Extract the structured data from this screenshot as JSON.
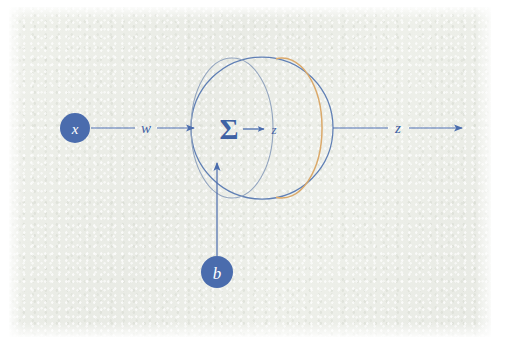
{
  "figure": {
    "kind": "neuron-computation-diagram",
    "background_color": "#eceee8",
    "margin_color": "#ffffff"
  },
  "palette": {
    "node_fill": "#4a6cad",
    "node_text": "#ffffff",
    "line_blue": "#4a6cad",
    "sphere_outline": "#5f7fb5",
    "inner_ellipse": "#93a5bf",
    "accent_orange": "#dba96a",
    "label_blue": "#3f62a4"
  },
  "nodes": [
    {
      "id": "input-node",
      "label": "x",
      "cx": 75,
      "cy": 128,
      "r": 15
    },
    {
      "id": "bias-node",
      "label": "b",
      "cx": 217,
      "cy": 272,
      "r": 16
    }
  ],
  "edges": [
    {
      "id": "weight-edge",
      "label": "w",
      "from": "input-node",
      "to": "neuron-body",
      "label_x": 146,
      "label_y": 127
    },
    {
      "id": "bias-edge",
      "label": "",
      "from": "bias-node",
      "to": "neuron-body"
    },
    {
      "id": "internal-edge",
      "label": "z",
      "from": "sum-symbol",
      "to": "activation-surface",
      "label_x": 273,
      "label_y": 133
    },
    {
      "id": "output-edge",
      "label": "z",
      "from": "neuron-body",
      "to": "output",
      "label_x": 398,
      "label_y": 127
    }
  ],
  "neuron_body": {
    "id": "neuron-body",
    "cx": 262,
    "cy": 128,
    "r": 71,
    "inner_ellipse": {
      "cx": 232,
      "cy": 128,
      "rx": 41,
      "ry": 70
    },
    "accent_ellipse": {
      "cx": 290,
      "cy": 128,
      "rx": 40,
      "ry": 70
    },
    "sum_symbol": "Σ",
    "sum_x": 229,
    "sum_y": 138
  },
  "labels": {
    "input": "x",
    "weight": "w",
    "bias": "b",
    "preactivation": "z",
    "output": "z",
    "sigma": "Σ"
  }
}
